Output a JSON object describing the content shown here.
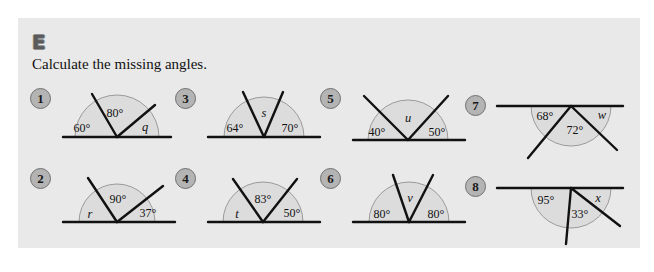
{
  "panel": {
    "background_color": "#e9e9e9",
    "section_letter": "E",
    "instruction": "Calculate the missing angles."
  },
  "style": {
    "ray_color": "#111111",
    "arc_fill": "#dcdcdc",
    "arc_stroke": "#9a9a9a",
    "badge_fill": "#b4b4b4",
    "badge_stroke": "#6f6f6f"
  },
  "problems": [
    {
      "number": "1",
      "orientation": "up",
      "labels": [
        {
          "text": "60°",
          "kind": "value"
        },
        {
          "text": "80°",
          "kind": "value"
        },
        {
          "text": "q",
          "kind": "variable"
        }
      ],
      "rays_deg": [
        120,
        40
      ],
      "angles_deg": [
        60,
        80,
        40
      ],
      "unknown": "q"
    },
    {
      "number": "2",
      "orientation": "up",
      "labels": [
        {
          "text": "r",
          "kind": "variable"
        },
        {
          "text": "90°",
          "kind": "value"
        },
        {
          "text": "37°",
          "kind": "value"
        }
      ],
      "rays_deg": [
        127,
        37
      ],
      "angles_deg": [
        53,
        90,
        37
      ],
      "unknown": "r"
    },
    {
      "number": "3",
      "orientation": "up",
      "labels": [
        {
          "text": "64°",
          "kind": "value"
        },
        {
          "text": "s",
          "kind": "variable"
        },
        {
          "text": "70°",
          "kind": "value"
        }
      ],
      "rays_deg": [
        116,
        70
      ],
      "angles_deg": [
        64,
        46,
        70
      ],
      "unknown": "s"
    },
    {
      "number": "4",
      "orientation": "up",
      "labels": [
        {
          "text": "t",
          "kind": "variable"
        },
        {
          "text": "83°",
          "kind": "value"
        },
        {
          "text": "50°",
          "kind": "value"
        }
      ],
      "rays_deg": [
        133,
        50
      ],
      "angles_deg": [
        47,
        83,
        50
      ],
      "unknown": "t"
    },
    {
      "number": "5",
      "orientation": "up",
      "labels": [
        {
          "text": "40°",
          "kind": "value"
        },
        {
          "text": "u",
          "kind": "variable"
        },
        {
          "text": "50°",
          "kind": "value"
        }
      ],
      "rays_deg": [
        140,
        50
      ],
      "angles_deg": [
        40,
        90,
        50
      ],
      "unknown": "u"
    },
    {
      "number": "6",
      "orientation": "up",
      "labels": [
        {
          "text": "80°",
          "kind": "value"
        },
        {
          "text": "v",
          "kind": "variable"
        },
        {
          "text": "80°",
          "kind": "value"
        }
      ],
      "rays_deg": [
        100,
        80
      ],
      "angles_deg": [
        80,
        20,
        80
      ],
      "unknown": "v"
    },
    {
      "number": "7",
      "orientation": "down",
      "labels": [
        {
          "text": "68°",
          "kind": "value"
        },
        {
          "text": "72°",
          "kind": "value"
        },
        {
          "text": "w",
          "kind": "variable"
        }
      ],
      "rays_deg": [
        248,
        320
      ],
      "angles_deg": [
        68,
        72,
        40
      ],
      "unknown": "w"
    },
    {
      "number": "8",
      "orientation": "down",
      "labels": [
        {
          "text": "95°",
          "kind": "value"
        },
        {
          "text": "33°",
          "kind": "value"
        },
        {
          "text": "x",
          "kind": "variable"
        }
      ],
      "rays_deg": [
        265,
        328
      ],
      "angles_deg": [
        95,
        33,
        52
      ],
      "unknown": "x"
    }
  ]
}
